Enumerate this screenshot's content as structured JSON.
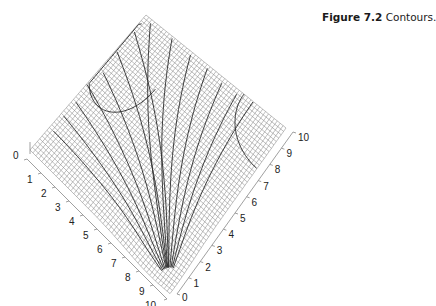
{
  "caption": {
    "label": "Figure 7.2",
    "text": "Contours."
  },
  "chart_data": {
    "type": "surface",
    "title": "Contours.",
    "figure_label": "Figure 7.2",
    "axes": {
      "left_axis": {
        "ticks": [
          "0",
          "1",
          "2",
          "3",
          "4",
          "5",
          "6",
          "7",
          "8",
          "9",
          "10"
        ],
        "range": [
          0,
          10
        ]
      },
      "right_axis": {
        "ticks": [
          "0",
          "1",
          "2",
          "3",
          "4",
          "5",
          "6",
          "7",
          "8",
          "9",
          "10"
        ],
        "range": [
          0,
          10
        ]
      }
    },
    "grid": true,
    "legend": null
  },
  "left_ticks": [
    "0",
    "1",
    "2",
    "3",
    "4",
    "5",
    "6",
    "7",
    "8",
    "9",
    "10"
  ],
  "right_ticks": [
    "0",
    "1",
    "2",
    "3",
    "4",
    "5",
    "6",
    "7",
    "8",
    "9",
    "10"
  ],
  "colors": {
    "mesh": "#6e6e6e",
    "contour": "#2a2a2a",
    "axis": "#888888"
  }
}
